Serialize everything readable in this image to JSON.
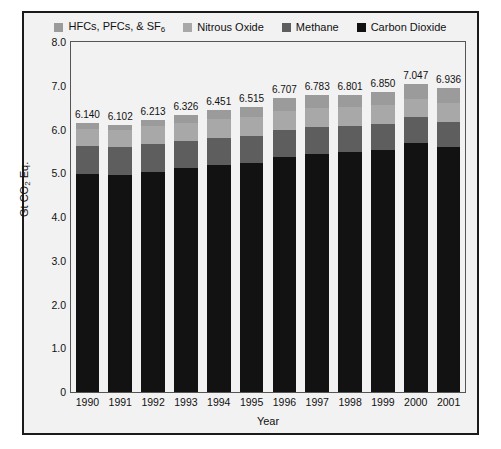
{
  "figure": {
    "background": "#f2f2f2",
    "border_color": "#1b1b1b"
  },
  "legend": {
    "position": "top-center",
    "items": [
      {
        "label": "HFCs, PFCs, & SF",
        "sub": "6",
        "color": "#9b9b9b",
        "name": "hfcs-pfcs-sf6"
      },
      {
        "label": "Nitrous Oxide",
        "sub": "",
        "color": "#a8a8a8",
        "name": "nitrous-oxide"
      },
      {
        "label": "Methane",
        "sub": "",
        "color": "#5e5e5e",
        "name": "methane"
      },
      {
        "label": "Carbon Dioxide",
        "sub": "",
        "color": "#121212",
        "name": "carbon-dioxide"
      }
    ]
  },
  "chart_data": {
    "type": "bar",
    "stacked": true,
    "title": "",
    "xlabel": "Year",
    "ylabel_parts": {
      "pre": "Gt CO",
      "sub": "2",
      "post": " Eq."
    },
    "ylabel": "Gt CO2 Eq.",
    "ylim": [
      0,
      8.0
    ],
    "ytick_labels": [
      "8.0",
      "7.0",
      "6.0",
      "5.0",
      "4.0",
      "3.0",
      "2.0",
      "1.0",
      "0"
    ],
    "ytick_values": [
      8.0,
      7.0,
      6.0,
      5.0,
      4.0,
      3.0,
      2.0,
      1.0,
      0
    ],
    "grid": false,
    "categories": [
      "1990",
      "1991",
      "1992",
      "1993",
      "1994",
      "1995",
      "1996",
      "1997",
      "1998",
      "1999",
      "2000",
      "2001"
    ],
    "totals": [
      6.14,
      6.102,
      6.213,
      6.326,
      6.451,
      6.515,
      6.707,
      6.783,
      6.801,
      6.85,
      7.047,
      6.936
    ],
    "total_labels": [
      "6.140",
      "6.102",
      "6.213",
      "6.326",
      "6.451",
      "6.515",
      "6.707",
      "6.783",
      "6.801",
      "6.850",
      "7.047",
      "6.936"
    ],
    "series": [
      {
        "name": "Carbon Dioxide",
        "color": "#121212",
        "values": [
          4.98,
          4.96,
          5.03,
          5.12,
          5.19,
          5.23,
          5.38,
          5.45,
          5.48,
          5.54,
          5.69,
          5.6
        ]
      },
      {
        "name": "Methane",
        "color": "#5e5e5e",
        "values": [
          0.64,
          0.63,
          0.63,
          0.62,
          0.62,
          0.62,
          0.62,
          0.61,
          0.6,
          0.59,
          0.59,
          0.58
        ]
      },
      {
        "name": "Nitrous Oxide",
        "color": "#a8a8a8",
        "values": [
          0.4,
          0.4,
          0.41,
          0.41,
          0.43,
          0.44,
          0.43,
          0.43,
          0.43,
          0.42,
          0.42,
          0.42
        ]
      },
      {
        "name": "HFCs, PFCs, & SF6",
        "color": "#9b9b9b",
        "values": [
          0.12,
          0.11,
          0.14,
          0.18,
          0.21,
          0.23,
          0.28,
          0.29,
          0.29,
          0.3,
          0.35,
          0.34
        ]
      }
    ]
  }
}
